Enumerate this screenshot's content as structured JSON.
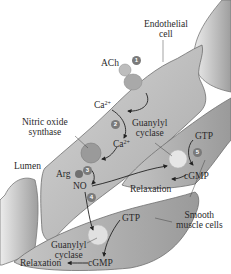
{
  "diagram": {
    "type": "biological-pathway",
    "labels": {
      "endothelial_cell": [
        "Endothelial",
        "cell"
      ],
      "ach": "ACh",
      "ca_top": "Ca",
      "ca_top_sup": "2+",
      "nitric_oxide_synthase": [
        "Nitric oxide",
        "synthase"
      ],
      "guanylyl_cyclase_top": [
        "Guanylyl",
        "cyclase"
      ],
      "ca_mid": "Ca",
      "ca_mid_sup": "2+",
      "lumen": "Lumen",
      "arg": "Arg",
      "no": "NO",
      "gtp_upper": "GTP",
      "cgmp_upper": "cGMP",
      "relaxation_upper": "Relaxation",
      "gtp_lower": "GTP",
      "smooth_muscle_cells": [
        "Smooth",
        "muscle cells"
      ],
      "guanylyl_cyclase_lower": [
        "Guanylyl",
        "cyclase"
      ],
      "relaxation_lower": "Relaxation",
      "cgmp_lower": "cGMP"
    },
    "steps": [
      "1",
      "2",
      "3",
      "4",
      "5"
    ],
    "colors": {
      "cell_fill": "#b8b8b8",
      "cell_light": "#d9d9d9",
      "cell_dark": "#8c8c8c",
      "receptor": "#a9a9a9",
      "enzyme": "#9a9a9a",
      "cyclase": "#e6e6e6",
      "badge": "#7a7a7a",
      "arrow": "#222222"
    }
  }
}
